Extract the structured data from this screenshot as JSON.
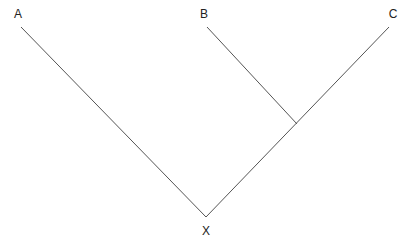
{
  "diagram": {
    "type": "phylogenetic-tree",
    "nodes": {
      "A": {
        "label": "A",
        "x": 18,
        "y": 14
      },
      "B": {
        "label": "B",
        "x": 204,
        "y": 14
      },
      "C": {
        "label": "C",
        "x": 393,
        "y": 14
      },
      "X": {
        "label": "X",
        "x": 206,
        "y": 234
      }
    },
    "edges": [
      {
        "from": "X",
        "to": "A",
        "x1": 206,
        "y1": 217,
        "x2": 21,
        "y2": 27
      },
      {
        "from": "X",
        "to": "C",
        "x1": 206,
        "y1": 217,
        "x2": 389,
        "y2": 27
      },
      {
        "from": "BC-junction",
        "to": "B",
        "x1": 297,
        "y1": 124,
        "x2": 207,
        "y2": 27
      }
    ],
    "line_color": "#555555"
  }
}
